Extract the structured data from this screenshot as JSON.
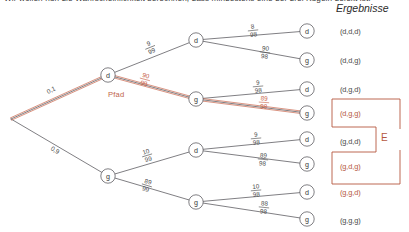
{
  "header": {
    "cut_off_text": "Wir wollen nun die Wahrscheinlichkeit berechnen, dass mindestens eine der drei Kugeln defekt ist.",
    "results_title": "Ergebnisse",
    "event_label": "E",
    "path_label": "Pfad"
  },
  "tree": {
    "root": {
      "x": 11,
      "y": 119
    },
    "nodes": [
      {
        "id": "d1",
        "label": "d",
        "x": 108,
        "y": 75,
        "level": 1
      },
      {
        "id": "g1",
        "label": "g",
        "x": 108,
        "y": 176,
        "level": 1
      },
      {
        "id": "d2a",
        "label": "d",
        "x": 196,
        "y": 40,
        "level": 2
      },
      {
        "id": "g2a",
        "label": "g",
        "x": 196,
        "y": 99,
        "level": 2
      },
      {
        "id": "d2b",
        "label": "d",
        "x": 196,
        "y": 150,
        "level": 2
      },
      {
        "id": "g2b",
        "label": "g",
        "x": 196,
        "y": 202,
        "level": 2
      },
      {
        "id": "d3a",
        "label": "d",
        "x": 307,
        "y": 31,
        "level": 3
      },
      {
        "id": "g3a",
        "label": "g",
        "x": 307,
        "y": 60,
        "level": 3
      },
      {
        "id": "d3b",
        "label": "d",
        "x": 307,
        "y": 89,
        "level": 3
      },
      {
        "id": "g3b",
        "label": "g",
        "x": 307,
        "y": 113,
        "level": 3
      },
      {
        "id": "d3c",
        "label": "d",
        "x": 307,
        "y": 139,
        "level": 3
      },
      {
        "id": "g3c",
        "label": "g",
        "x": 307,
        "y": 164,
        "level": 3
      },
      {
        "id": "d3d",
        "label": "d",
        "x": 307,
        "y": 192,
        "level": 3
      },
      {
        "id": "g3d",
        "label": "g",
        "x": 307,
        "y": 219,
        "level": 3
      }
    ],
    "edges": [
      {
        "from": "root",
        "to": "d1",
        "prob": "0,1",
        "type": "decimal",
        "highlighted": true,
        "lx": 52,
        "ly": 92,
        "rot": -25
      },
      {
        "from": "root",
        "to": "g1",
        "prob": "0,9",
        "type": "decimal",
        "highlighted": false,
        "lx": 54,
        "ly": 152,
        "rot": 30
      },
      {
        "from": "d1",
        "to": "d2a",
        "num": "9",
        "den": "99",
        "highlighted": false,
        "lx": 150,
        "ly": 47,
        "rot": -22
      },
      {
        "from": "d1",
        "to": "g2a",
        "num": "90",
        "den": "99",
        "highlighted": true,
        "lx": 145,
        "ly": 79,
        "rot": 15
      },
      {
        "from": "g1",
        "to": "d2b",
        "num": "10",
        "den": "99",
        "highlighted": false,
        "lx": 147,
        "ly": 155,
        "rot": -17
      },
      {
        "from": "g1",
        "to": "g2b",
        "num": "89",
        "den": "99",
        "highlighted": false,
        "lx": 147,
        "ly": 185,
        "rot": 17
      },
      {
        "from": "d2a",
        "to": "d3a",
        "num": "8",
        "den": "98",
        "highlighted": false,
        "lx": 253,
        "ly": 30,
        "rot": -6
      },
      {
        "from": "d2a",
        "to": "g3a",
        "num": "90",
        "den": "98",
        "highlighted": false,
        "lx": 265,
        "ly": 52,
        "rot": 7
      },
      {
        "from": "g2a",
        "to": "d3b",
        "num": "9",
        "den": "98",
        "highlighted": false,
        "lx": 258,
        "ly": 86,
        "rot": -5
      },
      {
        "from": "g2a",
        "to": "g3b",
        "num": "89",
        "den": "98",
        "highlighted": true,
        "lx": 264,
        "ly": 102,
        "rot": 4
      },
      {
        "from": "d2b",
        "to": "d3c",
        "num": "9",
        "den": "98",
        "highlighted": false,
        "lx": 256,
        "ly": 138,
        "rot": -5
      },
      {
        "from": "d2b",
        "to": "g3c",
        "num": "89",
        "den": "98",
        "highlighted": false,
        "lx": 263,
        "ly": 159,
        "rot": 6
      },
      {
        "from": "g2b",
        "to": "d3d",
        "num": "10",
        "den": "98",
        "highlighted": false,
        "lx": 256,
        "ly": 190,
        "rot": -5
      },
      {
        "from": "g2b",
        "to": "g3d",
        "num": "88",
        "den": "98",
        "highlighted": false,
        "lx": 264,
        "ly": 207,
        "rot": 6
      }
    ]
  },
  "results": [
    {
      "text": "(d,d,d)",
      "y": 27,
      "x": 340,
      "highlighted": false
    },
    {
      "text": "(d,d,g)",
      "y": 56,
      "x": 340,
      "highlighted": false
    },
    {
      "text": "(d,g,d)",
      "y": 85,
      "x": 340,
      "highlighted": false
    },
    {
      "text": "(d,g,g)",
      "y": 109,
      "x": 340,
      "highlighted": true
    },
    {
      "text": "(g,d,d)",
      "y": 137,
      "x": 340,
      "highlighted": false
    },
    {
      "text": "(g,d,g)",
      "y": 162,
      "x": 340,
      "highlighted": true
    },
    {
      "text": "(g,g,d)",
      "y": 188,
      "x": 340,
      "highlighted": true
    },
    {
      "text": "(g,g,g)",
      "y": 216,
      "x": 340,
      "highlighted": false
    }
  ],
  "colors": {
    "accent_red": "#b5573f",
    "path_red": "#c8644a",
    "line_gray": "#55545a",
    "text_gray": "#4a4a4a"
  }
}
